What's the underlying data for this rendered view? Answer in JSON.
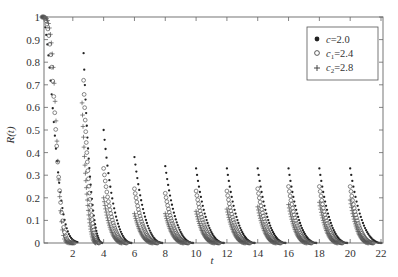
{
  "chart_data": {
    "type": "scatter",
    "title": "",
    "xlabel": "t",
    "ylabel": "R(t)",
    "xlim": [
      0,
      22
    ],
    "ylim": [
      0,
      1
    ],
    "x_ticks": [
      2,
      4,
      6,
      8,
      10,
      12,
      14,
      16,
      18,
      20,
      22
    ],
    "y_ticks": [
      0,
      0.1,
      0.2,
      0.3,
      0.4,
      0.5,
      0.6,
      0.7,
      0.8,
      0.9,
      1
    ],
    "y_tick_labels": [
      "0",
      "0.1",
      "0.2",
      "0.3",
      "0.4",
      "0.5",
      "0.6",
      "0.7",
      "0.8",
      "0.9",
      "1"
    ],
    "grid": false,
    "legend_position": "upper right",
    "series": [
      {
        "name": "c=2.0",
        "legend_label": "c=2.0",
        "marker": "filled-dot",
        "segments": [
          {
            "t_start": 0.0,
            "t_end": 2.3,
            "peak": 1.0
          },
          {
            "t_start": 2.7,
            "t_end": 3.9,
            "peak": 0.84
          },
          {
            "t_start": 4.0,
            "t_end": 5.8,
            "peak": 0.5
          },
          {
            "t_start": 6.0,
            "t_end": 7.8,
            "peak": 0.38
          },
          {
            "t_start": 8.0,
            "t_end": 9.8,
            "peak": 0.34
          },
          {
            "t_start": 10.0,
            "t_end": 11.8,
            "peak": 0.33
          },
          {
            "t_start": 12.0,
            "t_end": 13.8,
            "peak": 0.33
          },
          {
            "t_start": 14.0,
            "t_end": 15.8,
            "peak": 0.33
          },
          {
            "t_start": 16.0,
            "t_end": 17.8,
            "peak": 0.33
          },
          {
            "t_start": 18.0,
            "t_end": 19.8,
            "peak": 0.33
          },
          {
            "t_start": 20.0,
            "t_end": 22.0,
            "peak": 0.33
          }
        ]
      },
      {
        "name": "c1=2.4",
        "legend_label": "c",
        "legend_sub": "1",
        "legend_value": "=2.4",
        "marker": "open-circle",
        "segments": [
          {
            "t_start": 0.0,
            "t_end": 2.1,
            "peak": 1.0
          },
          {
            "t_start": 2.7,
            "t_end": 3.7,
            "peak": 0.72
          },
          {
            "t_start": 4.0,
            "t_end": 5.5,
            "peak": 0.33
          },
          {
            "t_start": 6.0,
            "t_end": 7.5,
            "peak": 0.24
          },
          {
            "t_start": 8.0,
            "t_end": 9.5,
            "peak": 0.22
          },
          {
            "t_start": 10.0,
            "t_end": 11.5,
            "peak": 0.23
          },
          {
            "t_start": 12.0,
            "t_end": 13.5,
            "peak": 0.23
          },
          {
            "t_start": 14.0,
            "t_end": 15.5,
            "peak": 0.24
          },
          {
            "t_start": 16.0,
            "t_end": 17.5,
            "peak": 0.25
          },
          {
            "t_start": 18.0,
            "t_end": 19.5,
            "peak": 0.25
          },
          {
            "t_start": 20.0,
            "t_end": 21.5,
            "peak": 0.25
          }
        ]
      },
      {
        "name": "c2=2.8",
        "legend_label": "c",
        "legend_sub": "2",
        "legend_value": "=2.8",
        "marker": "plus",
        "segments": [
          {
            "t_start": 0.0,
            "t_end": 2.0,
            "peak": 1.0
          },
          {
            "t_start": 2.6,
            "t_end": 3.5,
            "peak": 0.62
          },
          {
            "t_start": 4.0,
            "t_end": 5.2,
            "peak": 0.2
          },
          {
            "t_start": 6.0,
            "t_end": 7.2,
            "peak": 0.13
          },
          {
            "t_start": 8.0,
            "t_end": 9.2,
            "peak": 0.13
          },
          {
            "t_start": 10.0,
            "t_end": 11.2,
            "peak": 0.14
          },
          {
            "t_start": 12.0,
            "t_end": 13.2,
            "peak": 0.15
          },
          {
            "t_start": 14.0,
            "t_end": 15.2,
            "peak": 0.16
          },
          {
            "t_start": 16.0,
            "t_end": 17.2,
            "peak": 0.17
          },
          {
            "t_start": 18.0,
            "t_end": 19.2,
            "peak": 0.18
          },
          {
            "t_start": 20.0,
            "t_end": 21.2,
            "peak": 0.19
          }
        ]
      }
    ]
  },
  "legend": {
    "items": [
      {
        "symbol": "●",
        "label": "c",
        "sub": "",
        "value": "=2.0"
      },
      {
        "symbol": "○",
        "label": "c",
        "sub": "1",
        "value": "=2.4"
      },
      {
        "symbol": "+",
        "label": "c",
        "sub": "2",
        "value": "=2.8"
      }
    ]
  },
  "axes": {
    "xlabel": "t",
    "ylabel": "R(t)"
  }
}
